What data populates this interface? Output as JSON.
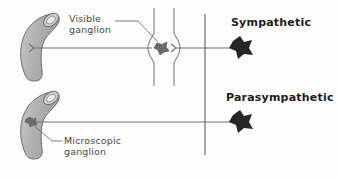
{
  "figure": {
    "title_visible": false,
    "background_color": "#fdfdfd",
    "ink_color": "#555555",
    "organ_fill": "#b3b3b3",
    "organ_stroke": "#6e6e6e",
    "ganglion_fill": "#6b6b6b",
    "effector_fill": "#262626",
    "text_color": "#3b3b3b",
    "heading_color": "#1d1d1d"
  },
  "labels": {
    "visible_ganglion": "Visible\nganglion",
    "visible_ganglion_line1": "Visible",
    "visible_ganglion_line2": "ganglion",
    "microscopic_ganglion": "Microscopic\nganglion",
    "microscopic_ganglion_line1": "Microscopic",
    "microscopic_ganglion_line2": "ganglion",
    "sympathetic": "Sympathetic",
    "parasympathetic": "Parasympathetic"
  },
  "diagram": {
    "rows": [
      {
        "name": "sympathetic-row",
        "organ_label": "organ-upper",
        "ganglion_type": "visible-ganglion",
        "ganglion_position": "near-spinal-cord",
        "effector_label": "Sympathetic",
        "nerve_y": 48
      },
      {
        "name": "parasympathetic-row",
        "organ_label": "organ-lower",
        "ganglion_type": "microscopic-ganglion",
        "ganglion_position": "on-organ-wall",
        "effector_label": "Parasympathetic",
        "nerve_y": 122
      }
    ],
    "midline": {
      "name": "midline-vertical",
      "x": 205,
      "y_top": 14,
      "y_bottom": 155
    },
    "spinal_cord": {
      "name": "spinal-cord",
      "x_left": 152,
      "x_right": 176,
      "y_top": 8,
      "y_bottom": 86
    }
  },
  "icons": {
    "organ": "curved-tube-organ-icon",
    "ganglion": "star-blob-ganglion-icon",
    "effector": "star-blob-effector-icon",
    "arrowhead": "arrowhead-icon",
    "leader": "leader-line-icon"
  }
}
